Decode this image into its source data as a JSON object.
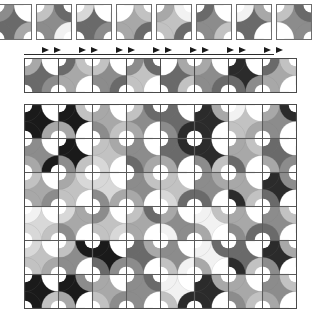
{
  "figure": {
    "background_color": "#ffffff",
    "grid_line_color": "#4a4a4a",
    "tile_border_color": "#6e6e6e",
    "arrow_color": "#1b1b1b",
    "rule_color": "#2a2a2a"
  },
  "palette": {
    "white": "#ffffff",
    "near_white": "#f2f2f2",
    "light": "#d8d8d8",
    "light_mid": "#c2c2c2",
    "mid": "#a8a8a8",
    "mid_dark": "#8c8c8c",
    "dark": "#6a6a6a",
    "darker": "#4a4a4a",
    "very_dark": "#2b2b2b",
    "black": "#1a1a1a"
  },
  "sample_row": {
    "label": "sample-tile-row",
    "tile_count": 8,
    "tile_size": 34,
    "x_positions": [
      -4,
      36,
      76,
      116,
      156,
      196,
      236,
      276
    ],
    "tiles": [
      {
        "id": "s1",
        "quads": [
          "#8c8c8c",
          "#ffffff",
          "#a8a8a8",
          "#6a6a6a"
        ],
        "base": "#6a6a6a"
      },
      {
        "id": "s2",
        "quads": [
          "#c2c2c2",
          "#6a6a6a",
          "#f2f2f2",
          "#8c8c8c"
        ],
        "base": "#8c8c8c"
      },
      {
        "id": "s3",
        "quads": [
          "#d8d8d8",
          "#ffffff",
          "#8c8c8c",
          "#6a6a6a"
        ],
        "base": "#6a6a6a"
      },
      {
        "id": "s4",
        "quads": [
          "#ffffff",
          "#c2c2c2",
          "#6a6a6a",
          "#a8a8a8"
        ],
        "base": "#a8a8a8"
      },
      {
        "id": "s5",
        "quads": [
          "#a8a8a8",
          "#f2f2f2",
          "#6a6a6a",
          "#c2c2c2"
        ],
        "base": "#c2c2c2"
      },
      {
        "id": "s6",
        "quads": [
          "#6a6a6a",
          "#ffffff",
          "#c2c2c2",
          "#8c8c8c"
        ],
        "base": "#8c8c8c"
      },
      {
        "id": "s7",
        "quads": [
          "#f2f2f2",
          "#a8a8a8",
          "#ffffff",
          "#6a6a6a"
        ],
        "base": "#6a6a6a"
      },
      {
        "id": "s8",
        "quads": [
          "#c2c2c2",
          "#6a6a6a",
          "#8c8c8c",
          "#ffffff"
        ],
        "base": "#8c8c8c"
      }
    ]
  },
  "arrow_row": {
    "label": "transition-arrow-markers",
    "marker_count": 7,
    "marker_glyph": "right-triangle-pair",
    "x_positions": [
      42,
      79,
      116,
      153,
      190,
      227,
      264
    ],
    "rule": {
      "x": 24,
      "y": 10,
      "width": 250
    }
  },
  "strip_row": {
    "label": "tile-strip-row",
    "tile_count": 8,
    "tile_size": 33,
    "tiles": [
      {
        "id": "t1",
        "quads": [
          "#a8a8a8",
          "#ffffff",
          "#8c8c8c",
          "#6a6a6a"
        ],
        "base": "#6a6a6a"
      },
      {
        "id": "t2",
        "quads": [
          "#6a6a6a",
          "#c2c2c2",
          "#ffffff",
          "#a8a8a8"
        ],
        "base": "#a8a8a8"
      },
      {
        "id": "t3",
        "quads": [
          "#c2c2c2",
          "#ffffff",
          "#6a6a6a",
          "#8c8c8c"
        ],
        "base": "#8c8c8c"
      },
      {
        "id": "t4",
        "quads": [
          "#8c8c8c",
          "#6a6a6a",
          "#ffffff",
          "#c2c2c2"
        ],
        "base": "#c2c2c2"
      },
      {
        "id": "t5",
        "quads": [
          "#ffffff",
          "#a8a8a8",
          "#c2c2c2",
          "#6a6a6a"
        ],
        "base": "#6a6a6a"
      },
      {
        "id": "t6",
        "quads": [
          "#a8a8a8",
          "#ffffff",
          "#6a6a6a",
          "#8c8c8c"
        ],
        "base": "#8c8c8c"
      },
      {
        "id": "t7",
        "quads": [
          "#2b2b2b",
          "#ffffff",
          "#8c8c8c",
          "#6a6a6a"
        ],
        "base": "#2b2b2b"
      },
      {
        "id": "t8",
        "quads": [
          "#6a6a6a",
          "#c2c2c2",
          "#ffffff",
          "#a8a8a8"
        ],
        "base": "#a8a8a8"
      }
    ]
  },
  "main_grid": {
    "label": "main-tiling-grid",
    "columns": 8,
    "rows": 6,
    "tile_size": 33,
    "origin": {
      "x": 24,
      "y": 104
    },
    "rows_data": [
      [
        {
          "id": "g11",
          "quads": [
            "#1a1a1a",
            "#ffffff",
            "#a8a8a8",
            "#1a1a1a"
          ],
          "base": "#1a1a1a"
        },
        {
          "id": "g12",
          "quads": [
            "#1a1a1a",
            "#c2c2c2",
            "#ffffff",
            "#a8a8a8"
          ],
          "base": "#1a1a1a"
        },
        {
          "id": "g13",
          "quads": [
            "#a8a8a8",
            "#ffffff",
            "#c2c2c2",
            "#8c8c8c"
          ],
          "base": "#a8a8a8"
        },
        {
          "id": "g14",
          "quads": [
            "#c2c2c2",
            "#6a6a6a",
            "#ffffff",
            "#a8a8a8"
          ],
          "base": "#8c8c8c"
        },
        {
          "id": "g15",
          "quads": [
            "#6a6a6a",
            "#ffffff",
            "#2b2b2b",
            "#8c8c8c"
          ],
          "base": "#6a6a6a"
        },
        {
          "id": "g16",
          "quads": [
            "#2b2b2b",
            "#a8a8a8",
            "#ffffff",
            "#2b2b2b"
          ],
          "base": "#2b2b2b"
        },
        {
          "id": "g17",
          "quads": [
            "#f2f2f2",
            "#ffffff",
            "#a8a8a8",
            "#c2c2c2"
          ],
          "base": "#c2c2c2"
        },
        {
          "id": "g18",
          "quads": [
            "#a8a8a8",
            "#2b2b2b",
            "#ffffff",
            "#8c8c8c"
          ],
          "base": "#8c8c8c"
        }
      ],
      [
        {
          "id": "g21",
          "quads": [
            "#8c8c8c",
            "#ffffff",
            "#1a1a1a",
            "#a8a8a8"
          ],
          "base": "#8c8c8c"
        },
        {
          "id": "g22",
          "quads": [
            "#1a1a1a",
            "#ffffff",
            "#c2c2c2",
            "#8c8c8c"
          ],
          "base": "#1a1a1a"
        },
        {
          "id": "g23",
          "quads": [
            "#c2c2c2",
            "#a8a8a8",
            "#ffffff",
            "#d8d8d8"
          ],
          "base": "#c2c2c2"
        },
        {
          "id": "g24",
          "quads": [
            "#8c8c8c",
            "#ffffff",
            "#a8a8a8",
            "#6a6a6a"
          ],
          "base": "#8c8c8c"
        },
        {
          "id": "g25",
          "quads": [
            "#6a6a6a",
            "#2b2b2b",
            "#ffffff",
            "#a8a8a8"
          ],
          "base": "#6a6a6a"
        },
        {
          "id": "g26",
          "quads": [
            "#2b2b2b",
            "#ffffff",
            "#c2c2c2",
            "#8c8c8c"
          ],
          "base": "#2b2b2b"
        },
        {
          "id": "g27",
          "quads": [
            "#a8a8a8",
            "#c2c2c2",
            "#ffffff",
            "#6a6a6a"
          ],
          "base": "#a8a8a8"
        },
        {
          "id": "g28",
          "quads": [
            "#6a6a6a",
            "#ffffff",
            "#8c8c8c",
            "#a8a8a8"
          ],
          "base": "#6a6a6a"
        }
      ],
      [
        {
          "id": "g31",
          "quads": [
            "#c2c2c2",
            "#ffffff",
            "#8c8c8c",
            "#a8a8a8"
          ],
          "base": "#a8a8a8"
        },
        {
          "id": "g32",
          "quads": [
            "#a8a8a8",
            "#d8d8d8",
            "#ffffff",
            "#c2c2c2"
          ],
          "base": "#c2c2c2"
        },
        {
          "id": "g33",
          "quads": [
            "#d8d8d8",
            "#ffffff",
            "#a8a8a8",
            "#8c8c8c"
          ],
          "base": "#d8d8d8"
        },
        {
          "id": "g34",
          "quads": [
            "#8c8c8c",
            "#c2c2c2",
            "#ffffff",
            "#a8a8a8"
          ],
          "base": "#8c8c8c"
        },
        {
          "id": "g35",
          "quads": [
            "#c2c2c2",
            "#ffffff",
            "#6a6a6a",
            "#d8d8d8"
          ],
          "base": "#c2c2c2"
        },
        {
          "id": "g36",
          "quads": [
            "#8c8c8c",
            "#a8a8a8",
            "#ffffff",
            "#6a6a6a"
          ],
          "base": "#8c8c8c"
        },
        {
          "id": "g37",
          "quads": [
            "#a8a8a8",
            "#ffffff",
            "#c2c2c2",
            "#2b2b2b"
          ],
          "base": "#a8a8a8"
        },
        {
          "id": "g38",
          "quads": [
            "#2b2b2b",
            "#8c8c8c",
            "#ffffff",
            "#6a6a6a"
          ],
          "base": "#2b2b2b"
        }
      ],
      [
        {
          "id": "g41",
          "quads": [
            "#f2f2f2",
            "#ffffff",
            "#c2c2c2",
            "#d8d8d8"
          ],
          "base": "#d8d8d8"
        },
        {
          "id": "g42",
          "quads": [
            "#d8d8d8",
            "#a8a8a8",
            "#ffffff",
            "#8c8c8c"
          ],
          "base": "#a8a8a8"
        },
        {
          "id": "g43",
          "quads": [
            "#8c8c8c",
            "#ffffff",
            "#d8d8d8",
            "#c2c2c2"
          ],
          "base": "#c2c2c2"
        },
        {
          "id": "g44",
          "quads": [
            "#c2c2c2",
            "#6a6a6a",
            "#ffffff",
            "#a8a8a8"
          ],
          "base": "#a8a8a8"
        },
        {
          "id": "g45",
          "quads": [
            "#a8a8a8",
            "#ffffff",
            "#8c8c8c",
            "#f2f2f2"
          ],
          "base": "#8c8c8c"
        },
        {
          "id": "g46",
          "quads": [
            "#f2f2f2",
            "#c2c2c2",
            "#ffffff",
            "#a8a8a8"
          ],
          "base": "#f2f2f2"
        },
        {
          "id": "g47",
          "quads": [
            "#a8a8a8",
            "#ffffff",
            "#6a6a6a",
            "#8c8c8c"
          ],
          "base": "#a8a8a8"
        },
        {
          "id": "g48",
          "quads": [
            "#8c8c8c",
            "#c2c2c2",
            "#ffffff",
            "#6a6a6a"
          ],
          "base": "#8c8c8c"
        }
      ],
      [
        {
          "id": "g51",
          "quads": [
            "#d8d8d8",
            "#ffffff",
            "#a8a8a8",
            "#c2c2c2"
          ],
          "base": "#c2c2c2"
        },
        {
          "id": "g52",
          "quads": [
            "#c2c2c2",
            "#1a1a1a",
            "#ffffff",
            "#8c8c8c"
          ],
          "base": "#8c8c8c"
        },
        {
          "id": "g53",
          "quads": [
            "#1a1a1a",
            "#ffffff",
            "#8c8c8c",
            "#6a6a6a"
          ],
          "base": "#1a1a1a"
        },
        {
          "id": "g54",
          "quads": [
            "#6a6a6a",
            "#a8a8a8",
            "#ffffff",
            "#8c8c8c"
          ],
          "base": "#6a6a6a"
        },
        {
          "id": "g55",
          "quads": [
            "#8c8c8c",
            "#ffffff",
            "#f2f2f2",
            "#c2c2c2"
          ],
          "base": "#8c8c8c"
        },
        {
          "id": "g56",
          "quads": [
            "#f2f2f2",
            "#6a6a6a",
            "#ffffff",
            "#a8a8a8"
          ],
          "base": "#f2f2f2"
        },
        {
          "id": "g57",
          "quads": [
            "#6a6a6a",
            "#ffffff",
            "#c2c2c2",
            "#2b2b2b"
          ],
          "base": "#6a6a6a"
        },
        {
          "id": "g58",
          "quads": [
            "#2b2b2b",
            "#a8a8a8",
            "#ffffff",
            "#8c8c8c"
          ],
          "base": "#2b2b2b"
        }
      ],
      [
        {
          "id": "g61",
          "quads": [
            "#1a1a1a",
            "#ffffff",
            "#c2c2c2",
            "#1a1a1a"
          ],
          "base": "#1a1a1a"
        },
        {
          "id": "g62",
          "quads": [
            "#1a1a1a",
            "#8c8c8c",
            "#ffffff",
            "#a8a8a8"
          ],
          "base": "#1a1a1a"
        },
        {
          "id": "g63",
          "quads": [
            "#a8a8a8",
            "#ffffff",
            "#8c8c8c",
            "#c2c2c2"
          ],
          "base": "#a8a8a8"
        },
        {
          "id": "g64",
          "quads": [
            "#8c8c8c",
            "#6a6a6a",
            "#ffffff",
            "#8c8c8c"
          ],
          "base": "#8c8c8c"
        },
        {
          "id": "g65",
          "quads": [
            "#f2f2f2",
            "#ffffff",
            "#2b2b2b",
            "#c2c2c2"
          ],
          "base": "#f2f2f2"
        },
        {
          "id": "g66",
          "quads": [
            "#2b2b2b",
            "#a8a8a8",
            "#ffffff",
            "#2b2b2b"
          ],
          "base": "#2b2b2b"
        },
        {
          "id": "g67",
          "quads": [
            "#a8a8a8",
            "#ffffff",
            "#c2c2c2",
            "#8c8c8c"
          ],
          "base": "#a8a8a8"
        },
        {
          "id": "g68",
          "quads": [
            "#8c8c8c",
            "#c2c2c2",
            "#ffffff",
            "#a8a8a8"
          ],
          "base": "#8c8c8c"
        }
      ]
    ]
  }
}
